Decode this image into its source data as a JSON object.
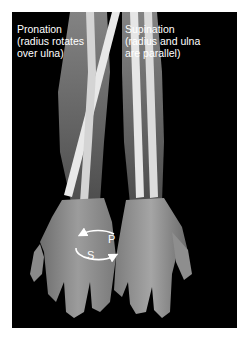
{
  "figure": {
    "background_color": "#000000",
    "labels": {
      "pronation": {
        "lines": [
          "Pronation",
          "(radius rotates",
          "over ulna)"
        ]
      },
      "supination": {
        "lines": [
          "Supination",
          "(radius and ulna",
          "are parallel)"
        ]
      }
    },
    "rotation_diagram": {
      "letters": {
        "p": "P",
        "s": "S"
      },
      "arrow_color": "#ffffff"
    },
    "icons": {
      "pronation_arm": "pronated-forearm-xray-icon",
      "supination_arm": "supinated-forearm-xray-icon",
      "rotation_arrows": "circular-rotation-arrows-icon"
    }
  }
}
